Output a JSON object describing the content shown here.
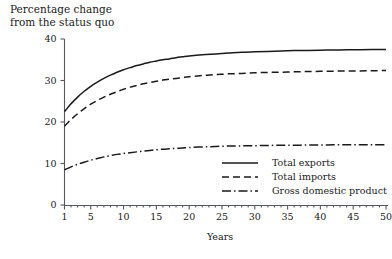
{
  "chart_data": {
    "type": "line",
    "title": "Percentage change\nfrom the status quo",
    "title_line1": "Percentage change",
    "title_line2": "from the status quo",
    "xlabel": "Years",
    "ylabel": "",
    "xlim": [
      1,
      50
    ],
    "ylim": [
      0,
      40
    ],
    "grid": false,
    "legend_position": "inside-lower-right",
    "xticks": [
      1,
      5,
      10,
      15,
      20,
      25,
      30,
      35,
      40,
      45,
      50
    ],
    "xticklabels": [
      "1",
      "5",
      "10",
      "15",
      "20",
      "25",
      "30",
      "35",
      "40",
      "45",
      "50"
    ],
    "yticks": [
      0,
      10,
      20,
      30,
      40
    ],
    "yticklabels": [
      "0",
      "10",
      "20",
      "30",
      "40"
    ],
    "x": [
      1,
      2,
      3,
      4,
      5,
      6,
      7,
      8,
      9,
      10,
      11,
      12,
      13,
      14,
      15,
      16,
      17,
      18,
      19,
      20,
      22,
      24,
      26,
      28,
      30,
      32,
      34,
      36,
      38,
      40,
      42,
      44,
      46,
      48,
      50
    ],
    "series": [
      {
        "name": "Total exports",
        "style": "solid",
        "values": [
          22.5,
          24.4,
          26.0,
          27.4,
          28.6,
          29.6,
          30.5,
          31.3,
          32.0,
          32.6,
          33.1,
          33.6,
          34.0,
          34.4,
          34.7,
          35.0,
          35.2,
          35.5,
          35.7,
          35.9,
          36.2,
          36.4,
          36.6,
          36.8,
          36.9,
          37.0,
          37.1,
          37.2,
          37.25,
          37.3,
          37.35,
          37.4,
          37.4,
          37.45,
          37.5
        ]
      },
      {
        "name": "Total imports",
        "style": "dashed",
        "values": [
          19.0,
          20.6,
          22.0,
          23.2,
          24.3,
          25.2,
          26.0,
          26.7,
          27.3,
          27.9,
          28.4,
          28.8,
          29.2,
          29.5,
          29.8,
          30.1,
          30.3,
          30.5,
          30.7,
          30.9,
          31.2,
          31.4,
          31.6,
          31.7,
          31.85,
          31.95,
          32.0,
          32.1,
          32.15,
          32.2,
          32.25,
          32.3,
          32.3,
          32.35,
          32.4
        ]
      },
      {
        "name": "Gross domestic product",
        "style": "dashdot",
        "values": [
          8.5,
          9.2,
          9.8,
          10.3,
          10.8,
          11.2,
          11.6,
          11.9,
          12.2,
          12.4,
          12.6,
          12.8,
          13.0,
          13.15,
          13.3,
          13.45,
          13.55,
          13.65,
          13.75,
          13.85,
          14.0,
          14.1,
          14.2,
          14.25,
          14.3,
          14.35,
          14.4,
          14.4,
          14.45,
          14.45,
          14.5,
          14.5,
          14.5,
          14.5,
          14.5
        ]
      }
    ],
    "legend": [
      {
        "label": "Total exports",
        "style": "solid"
      },
      {
        "label": "Total imports",
        "style": "dashed"
      },
      {
        "label": "Gross domestic product",
        "style": "dashdot"
      }
    ],
    "colors": {
      "line": "#1a1a1a",
      "axis": "#55585c",
      "background": "#ffffff"
    }
  }
}
